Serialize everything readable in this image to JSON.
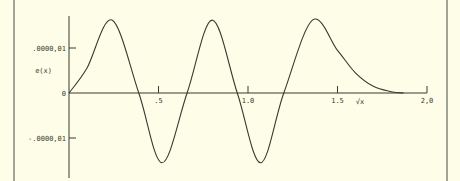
{
  "chart_data": {
    "type": "line",
    "title": "",
    "xlabel": "√x",
    "ylabel": "e(x)",
    "xlim": [
      0,
      2.0
    ],
    "ylim": [
      -1.6,
      1.7
    ],
    "x_ticks": [
      {
        "value": 0.5,
        "label": ".5"
      },
      {
        "value": 1.0,
        "label": "1.0"
      },
      {
        "value": 1.5,
        "label": "1.5"
      },
      {
        "value": 2.0,
        "label": "2,0"
      }
    ],
    "y_ticks": [
      {
        "value": 1,
        "label": ".0000,01"
      },
      {
        "value": 0,
        "label": "0"
      },
      {
        "value": -1,
        "label": "-.0000,01"
      }
    ],
    "grid": false,
    "legend": null,
    "series": [
      {
        "name": "e(x)",
        "x": [
          0,
          0.1,
          0.24,
          0.39,
          0.52,
          0.66,
          0.8,
          0.94,
          1.07,
          1.2,
          1.36,
          1.5,
          1.6,
          1.7,
          1.8,
          1.87
        ],
        "y": [
          0,
          0.55,
          1.62,
          0,
          -1.55,
          0,
          1.62,
          0,
          -1.55,
          0,
          1.62,
          0.95,
          0.45,
          0.15,
          0.03,
          0
        ]
      }
    ],
    "colors": {
      "background": "#fdfde8",
      "ink": "#3a3a30"
    }
  }
}
